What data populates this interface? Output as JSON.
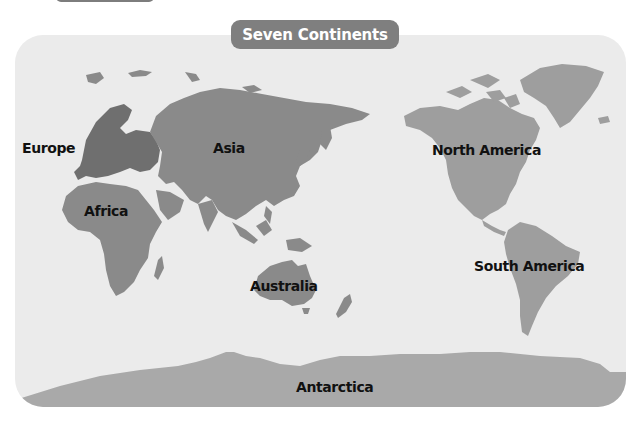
{
  "title": "Seven Continents",
  "colors": {
    "panel_bg": "#ebebeb",
    "land_old_world": "#8a8a8a",
    "land_europe": "#6f6f6f",
    "land_americas": "#9e9e9e",
    "land_antarctica": "#a9a9a9",
    "title_pill": "#7f7f7f",
    "label_text": "#111111"
  },
  "continents": [
    {
      "name": "Europe",
      "label_x": 22,
      "label_y": 140
    },
    {
      "name": "Asia",
      "label_x": 213,
      "label_y": 140
    },
    {
      "name": "North America",
      "label_x": 432,
      "label_y": 142
    },
    {
      "name": "Africa",
      "label_x": 84,
      "label_y": 203
    },
    {
      "name": "South America",
      "label_x": 474,
      "label_y": 258
    },
    {
      "name": "Australia",
      "label_x": 250,
      "label_y": 278
    },
    {
      "name": "Antarctica",
      "label_x": 296,
      "label_y": 379
    }
  ]
}
